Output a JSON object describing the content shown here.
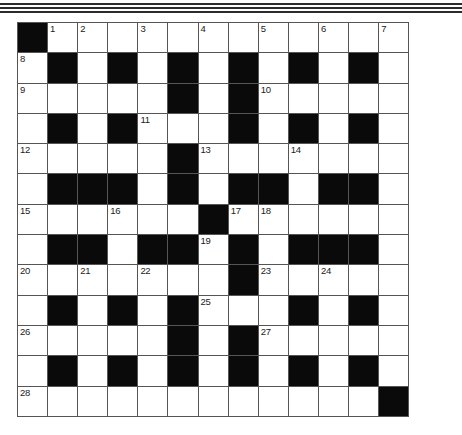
{
  "puzzle": {
    "type": "crossword",
    "rows": 13,
    "cols": 13,
    "colors": {
      "black": "#0a0a0a",
      "white": "#ffffff",
      "gridline": "#555555",
      "rule": "#2b2b2b"
    },
    "layout": [
      "#............",
      ".#.#.#.#.#.#.",
      ".....#.#.....",
      ".#.#...#.#.#.",
      ".....#.......",
      ".###.#.##.##.",
      "......#......",
      ".##.##.#.###.",
      ".......#.....",
      ".#.#.#...#.#.",
      ".....#.#.....",
      ".#.#.#.#.#.#.",
      "............#"
    ],
    "numbers": [
      {
        "r": 0,
        "c": 1,
        "n": "1"
      },
      {
        "r": 0,
        "c": 2,
        "n": "2"
      },
      {
        "r": 0,
        "c": 4,
        "n": "3"
      },
      {
        "r": 0,
        "c": 6,
        "n": "4"
      },
      {
        "r": 0,
        "c": 8,
        "n": "5"
      },
      {
        "r": 0,
        "c": 10,
        "n": "6"
      },
      {
        "r": 0,
        "c": 12,
        "n": "7"
      },
      {
        "r": 1,
        "c": 0,
        "n": "8"
      },
      {
        "r": 2,
        "c": 0,
        "n": "9"
      },
      {
        "r": 2,
        "c": 8,
        "n": "10"
      },
      {
        "r": 3,
        "c": 4,
        "n": "11"
      },
      {
        "r": 4,
        "c": 0,
        "n": "12"
      },
      {
        "r": 4,
        "c": 6,
        "n": "13"
      },
      {
        "r": 4,
        "c": 9,
        "n": "14"
      },
      {
        "r": 6,
        "c": 0,
        "n": "15"
      },
      {
        "r": 6,
        "c": 3,
        "n": "16"
      },
      {
        "r": 6,
        "c": 7,
        "n": "17"
      },
      {
        "r": 6,
        "c": 8,
        "n": "18"
      },
      {
        "r": 7,
        "c": 6,
        "n": "19"
      },
      {
        "r": 8,
        "c": 0,
        "n": "20"
      },
      {
        "r": 8,
        "c": 2,
        "n": "21"
      },
      {
        "r": 8,
        "c": 4,
        "n": "22"
      },
      {
        "r": 8,
        "c": 8,
        "n": "23"
      },
      {
        "r": 8,
        "c": 10,
        "n": "24"
      },
      {
        "r": 9,
        "c": 6,
        "n": "25"
      },
      {
        "r": 10,
        "c": 0,
        "n": "26"
      },
      {
        "r": 10,
        "c": 8,
        "n": "27"
      },
      {
        "r": 12,
        "c": 0,
        "n": "28"
      }
    ]
  }
}
